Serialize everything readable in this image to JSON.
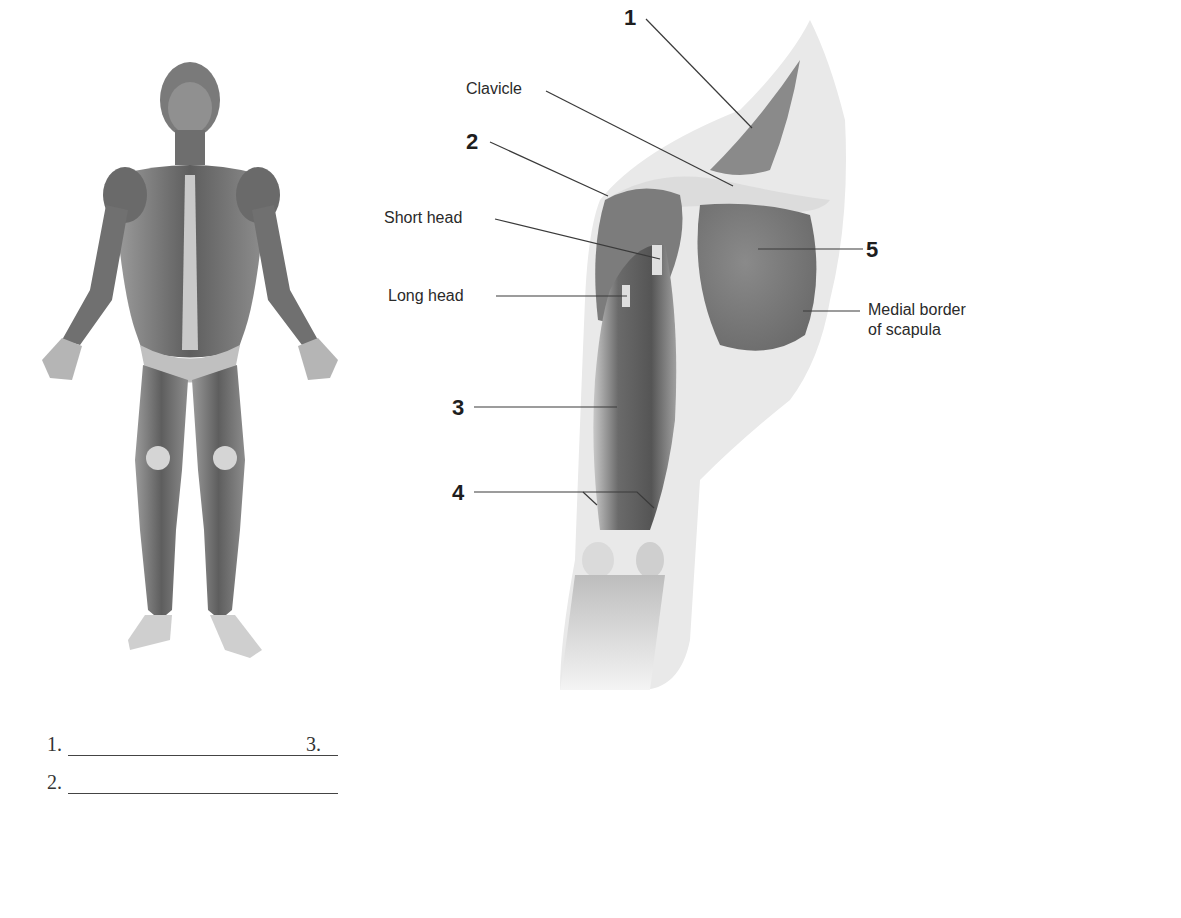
{
  "figure": {
    "full_body_illustration": "anterior view of human muscular system",
    "arm_illustration": "anterior view of right shoulder and arm muscles",
    "callouts": [
      {
        "id": "1",
        "label": "1"
      },
      {
        "id": "2",
        "label": "2"
      },
      {
        "id": "3",
        "label": "3"
      },
      {
        "id": "4",
        "label": "4"
      },
      {
        "id": "5",
        "label": "5"
      }
    ],
    "text_labels": {
      "clavicle": "Clavicle",
      "short_head": "Short head",
      "long_head": "Long head",
      "medial_border_line1": "Medial border",
      "medial_border_line2": "of scapula"
    }
  },
  "answers": [
    {
      "number": "1.",
      "value": ""
    },
    {
      "number": "2.",
      "value": ""
    },
    {
      "number": "3.",
      "value": ""
    },
    {
      "number": "4.",
      "value": ""
    },
    {
      "number": "5.",
      "value": ""
    }
  ],
  "word_bank": [
    "Biceps brachii",
    "Brachialis",
    "Deltoid",
    "Subscapularis",
    "Trapezius"
  ],
  "colors": {
    "text": "#2a2a2a",
    "leader_line": "#3a3a3a",
    "muscle_dark": "#5a5a5a",
    "muscle_mid": "#8a8a8a",
    "skin_light": "#d8d8d8"
  }
}
